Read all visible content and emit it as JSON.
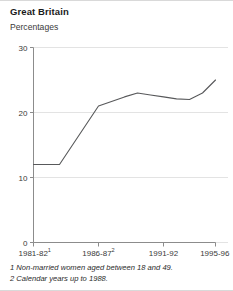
{
  "header": {
    "title": "Great Britain",
    "subtitle": "Percentages"
  },
  "footnotes": [
    "1 Non-married women aged between 18 and 49.",
    "2 Calendar years up to 1988."
  ],
  "colors": {
    "line": "#58595b",
    "grid": "#e3e3e3",
    "axis": "#8c8c8c",
    "text": "#3a3a3a",
    "title": "#1a1a1a",
    "background": "#ffffff"
  },
  "chart_data": {
    "type": "line",
    "title": "Great Britain",
    "subtitle": "Percentages",
    "xlabel": "",
    "ylabel": "Percentages",
    "ylim": [
      0,
      30
    ],
    "yticks": [
      0,
      10,
      20,
      30
    ],
    "ytick_labels": [
      "0",
      "10",
      "20",
      "30"
    ],
    "grid": true,
    "legend": false,
    "xtick_labels": [
      "1981-82",
      "1986-87",
      "1991-92",
      "1995-96"
    ],
    "xtick_superscripts": [
      "1",
      "2",
      "",
      ""
    ],
    "x": [
      "1981-82",
      "1982-83",
      "1983-84",
      "1984-85",
      "1985-86",
      "1986-87",
      "1987-88",
      "1988-89",
      "1989-90",
      "1990-91",
      "1991-92",
      "1992-93",
      "1993-94",
      "1994-95",
      "1995-96"
    ],
    "series": [
      {
        "name": "Percentages",
        "values": [
          12,
          12,
          12,
          15,
          18,
          21,
          21.7,
          22.4,
          23,
          22.7,
          22.4,
          22.1,
          22,
          23,
          25
        ]
      }
    ],
    "annotations": [
      "1 Non-married women aged between 18 and 49.",
      "2 Calendar years up to 1988."
    ]
  }
}
